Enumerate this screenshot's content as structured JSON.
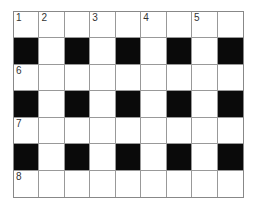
{
  "puzzle": {
    "type": "crossword",
    "rows": 7,
    "cols": 9,
    "colors": {
      "black": "#0a0a0a",
      "white": "#ffffff",
      "line": "#999999"
    },
    "black_cells": [
      [
        1,
        0
      ],
      [
        1,
        2
      ],
      [
        1,
        4
      ],
      [
        1,
        6
      ],
      [
        1,
        8
      ],
      [
        3,
        0
      ],
      [
        3,
        2
      ],
      [
        3,
        4
      ],
      [
        3,
        6
      ],
      [
        3,
        8
      ],
      [
        5,
        0
      ],
      [
        5,
        2
      ],
      [
        5,
        4
      ],
      [
        5,
        6
      ],
      [
        5,
        8
      ]
    ],
    "numbers": [
      {
        "r": 0,
        "c": 0,
        "n": "1"
      },
      {
        "r": 0,
        "c": 1,
        "n": "2"
      },
      {
        "r": 0,
        "c": 3,
        "n": "3"
      },
      {
        "r": 0,
        "c": 5,
        "n": "4"
      },
      {
        "r": 0,
        "c": 7,
        "n": "5"
      },
      {
        "r": 2,
        "c": 0,
        "n": "6"
      },
      {
        "r": 4,
        "c": 0,
        "n": "7"
      },
      {
        "r": 6,
        "c": 0,
        "n": "8"
      }
    ]
  }
}
